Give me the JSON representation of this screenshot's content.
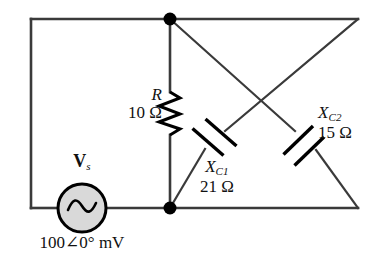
{
  "figure": {
    "name": "ac-bridge-circuit-schematic",
    "type": "electrical-circuit-diagram",
    "colors": {
      "wire": "#3a3a3a",
      "component": "#000000",
      "node": "#000000",
      "source_fill": "#d9d9d9",
      "background": "#ffffff",
      "text": "#111111"
    }
  },
  "components": {
    "resistor": {
      "symbol": "R",
      "value": "10 Ω",
      "icon": "resistor-zigzag-icon",
      "orientation": "vertical"
    },
    "source": {
      "symbol": "V",
      "symbol_subscript": "s",
      "value": "100∠0° mV",
      "icon": "ac-source-sine-icon",
      "kind": "ac-voltage-source"
    },
    "capacitor_1": {
      "symbol": "X",
      "symbol_subscript": "C1",
      "value": "21 Ω",
      "icon": "capacitor-plates-icon",
      "orientation": "diagonal-up-right"
    },
    "capacitor_2": {
      "symbol": "X",
      "symbol_subscript": "C2",
      "value": "15 Ω",
      "icon": "capacitor-plates-icon",
      "orientation": "diagonal-down-right"
    }
  },
  "nodes": [
    {
      "name": "top-node",
      "x": 170,
      "y": 20
    },
    {
      "name": "bottom-node",
      "x": 170,
      "y": 208
    }
  ]
}
